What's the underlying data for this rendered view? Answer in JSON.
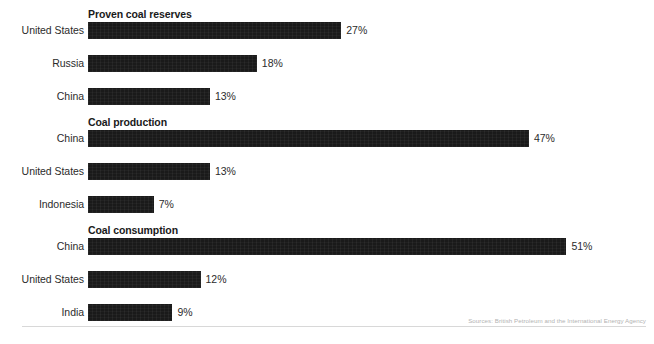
{
  "chart_data": {
    "type": "bar",
    "title": "",
    "xlabel": "",
    "ylabel": "",
    "orientation": "horizontal",
    "grid": false,
    "legend": false,
    "xlim": [
      0,
      55
    ],
    "value_suffix": "%",
    "bar_color": "#1a1a1a",
    "groups": [
      {
        "title": "Proven coal reserves",
        "categories": [
          "United States",
          "Russia",
          "China"
        ],
        "values": [
          27,
          18,
          13
        ],
        "value_labels": [
          "27%",
          "18%",
          "13%"
        ]
      },
      {
        "title": "Coal production",
        "categories": [
          "China",
          "United States",
          "Indonesia"
        ],
        "values": [
          47,
          13,
          7
        ],
        "value_labels": [
          "47%",
          "13%",
          "7%"
        ]
      },
      {
        "title": "Coal consumption",
        "categories": [
          "China",
          "United States",
          "India"
        ],
        "values": [
          51,
          12,
          9
        ],
        "value_labels": [
          "51%",
          "12%",
          "9%"
        ]
      }
    ],
    "source": "Sources: British Petroleum and the International Energy Agency"
  }
}
